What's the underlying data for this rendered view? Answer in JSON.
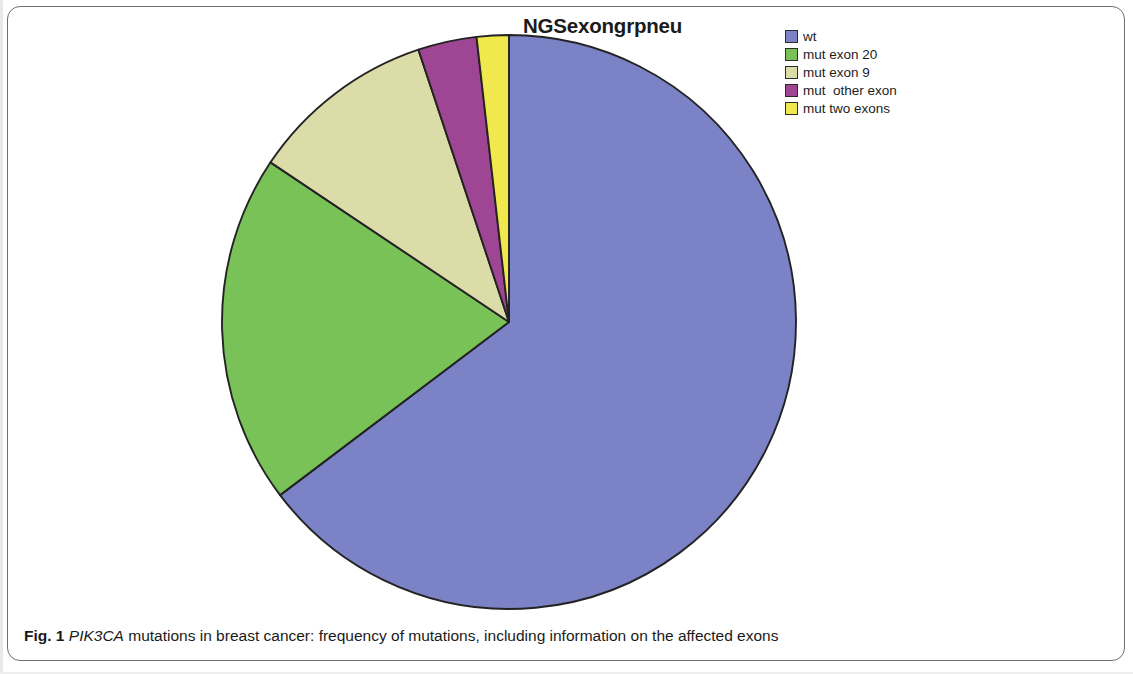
{
  "figure": {
    "caption_prefix": "Fig. 1",
    "caption_gene": "PIK3CA",
    "caption_rest": " mutations in breast cancer: frequency of mutations, including information on the affected exons"
  },
  "chart_data": {
    "type": "pie",
    "title": "NGSexongrpneu",
    "xlabel": "",
    "ylabel": "",
    "legend_position": "right",
    "grid": false,
    "categories": [
      "wt",
      "mut exon 20",
      "mut exon 9",
      "mut  other exon",
      "mut two exons"
    ],
    "values": [
      64.7,
      19.7,
      10.5,
      3.3,
      1.8
    ],
    "unit": "percent",
    "start_angle_deg": 0,
    "direction": "clockwise",
    "slices": [
      {
        "label": "wt",
        "percent": 64.7,
        "color": "#7b82c6",
        "start_deg": 0.0,
        "end_deg": 232.9
      },
      {
        "label": "mut exon 20",
        "percent": 19.7,
        "color": "#78c257",
        "start_deg": 232.9,
        "end_deg": 303.8
      },
      {
        "label": "mut exon 9",
        "percent": 10.5,
        "color": "#dcdca8",
        "start_deg": 303.8,
        "end_deg": 341.6
      },
      {
        "label": "mut  other exon",
        "percent": 3.3,
        "color": "#9e4593",
        "start_deg": 341.6,
        "end_deg": 353.5
      },
      {
        "label": "mut two exons",
        "percent": 1.8,
        "color": "#f1e84d",
        "start_deg": 353.5,
        "end_deg": 360.0
      }
    ]
  },
  "legend": {
    "items": [
      {
        "label": "wt",
        "color": "#7b82c6"
      },
      {
        "label": "mut exon 20",
        "color": "#78c257"
      },
      {
        "label": "mut exon 9",
        "color": "#dcdca8"
      },
      {
        "label": "mut  other exon",
        "color": "#9e4593"
      },
      {
        "label": "mut two exons",
        "color": "#f1e84d"
      }
    ]
  },
  "colors": {
    "outline": "#232323",
    "text": "#1a1a1a",
    "frame": "#6f6f6f",
    "background": "#ffffff"
  }
}
